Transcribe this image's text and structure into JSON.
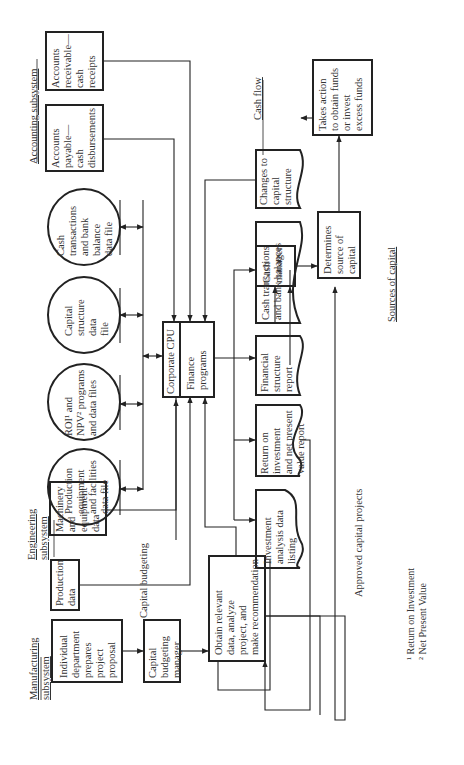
{
  "diagram": {
    "headings": {
      "manufacturing": [
        "Manufacturing",
        "subsystem"
      ],
      "engineering": [
        "Engineering",
        "subsystem"
      ],
      "accounting": "Accounting subsystem",
      "capital_budgeting": "Capital budgeting",
      "sources_of_capital": "Sources of capital",
      "cash_flow": "Cash flow",
      "approved_capital_projects": "Approved capital projects"
    },
    "processes": {
      "individual_department": [
        "Individual",
        "department",
        "prepares",
        "project",
        "proposal"
      ],
      "capital_budgeting_manager": [
        "Capital",
        "budgeting",
        "manager"
      ],
      "obtain_data": [
        "Obtain relevant",
        "data, analyze",
        "project, and",
        "make recommendation"
      ],
      "production_data": [
        "Production",
        "data"
      ],
      "machinery_data": [
        "Machinery",
        "and",
        "equipment",
        "data"
      ],
      "accounts_payable": [
        "Accounts",
        "payable—",
        "cash",
        "disbursements"
      ],
      "accounts_receivable": [
        "Accounts",
        "receivable—",
        "cash",
        "receipts"
      ],
      "corporate_cpu": "Corporate CPU",
      "finance_programs": [
        "Finance",
        "programs"
      ],
      "cash_manager": [
        "Cash",
        "manager"
      ],
      "determines_source": [
        "Determines",
        "source of",
        "capital"
      ],
      "takes_action": [
        "Takes action",
        "to obtain funds",
        "or invest",
        "excess funds"
      ]
    },
    "data_files": {
      "production_equipment": [
        "Production",
        "equipment",
        "and facilities",
        "data file"
      ],
      "roi_npv": [
        "ROI¹ and",
        "NPV² programs",
        "and data files"
      ],
      "capital_structure": [
        "Capital",
        "structure",
        "data",
        "file"
      ],
      "cash_transactions_file": [
        "Cash",
        "transactions",
        "and bank",
        "balance",
        "data file"
      ]
    },
    "reports": {
      "investment_listing": [
        "Investment",
        "analysis data",
        "listing"
      ],
      "roi_npv_report": [
        "Return on",
        "investment",
        "and net present",
        "value report"
      ],
      "financial_structure": [
        "Financial",
        "structure",
        "report"
      ],
      "cash_balances": [
        "Cash transactions",
        "and bank balances"
      ],
      "changes_capital": [
        "Changes to",
        "capital",
        "structure"
      ]
    },
    "footnotes": [
      "¹ Return on Investment",
      "² Net Present Value"
    ]
  }
}
